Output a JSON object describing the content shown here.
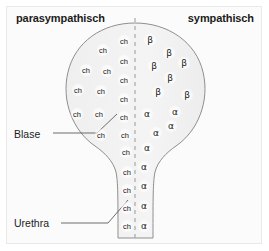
{
  "diagram": {
    "title_left": "parasympathisch",
    "title_right": "sympathisch",
    "labels": {
      "bladder": "Blase",
      "urethra": "Urethra"
    },
    "colors": {
      "left_fill_dark": "#b9b9b9",
      "left_fill_light": "#d8d8d8",
      "right_fill": "#f2f2f2",
      "outline": "#8c8c8c",
      "midline_dash": "#a9a9a9",
      "text": "#1c1c1c",
      "background": "#fbfbfb",
      "frame_border": "#e9e9e9"
    },
    "midline": {
      "x": 135,
      "y_top": 18,
      "y_bottom": 240,
      "style": "dashed"
    },
    "receptors": {
      "cholinergic_label": "ch",
      "beta_label": "β",
      "alpha_label": "α",
      "cholinergic": [
        {
          "x": 124,
          "y": 41
        },
        {
          "x": 103,
          "y": 50
        },
        {
          "x": 124,
          "y": 61
        },
        {
          "x": 86,
          "y": 70
        },
        {
          "x": 107,
          "y": 71
        },
        {
          "x": 124,
          "y": 80
        },
        {
          "x": 78,
          "y": 90
        },
        {
          "x": 101,
          "y": 91
        },
        {
          "x": 124,
          "y": 99
        },
        {
          "x": 77,
          "y": 114
        },
        {
          "x": 99,
          "y": 114
        },
        {
          "x": 124,
          "y": 117
        },
        {
          "x": 101,
          "y": 135
        },
        {
          "x": 125,
          "y": 135
        },
        {
          "x": 126,
          "y": 152
        },
        {
          "x": 127,
          "y": 172
        },
        {
          "x": 127,
          "y": 190
        },
        {
          "x": 127,
          "y": 208
        },
        {
          "x": 127,
          "y": 226
        }
      ],
      "beta": [
        {
          "x": 150,
          "y": 40
        },
        {
          "x": 169,
          "y": 53
        },
        {
          "x": 184,
          "y": 63
        },
        {
          "x": 154,
          "y": 66
        },
        {
          "x": 170,
          "y": 78
        },
        {
          "x": 158,
          "y": 92
        },
        {
          "x": 187,
          "y": 95
        }
      ],
      "alpha": [
        {
          "x": 147,
          "y": 114
        },
        {
          "x": 175,
          "y": 112
        },
        {
          "x": 171,
          "y": 126
        },
        {
          "x": 156,
          "y": 133
        },
        {
          "x": 147,
          "y": 148
        },
        {
          "x": 144,
          "y": 167
        },
        {
          "x": 144,
          "y": 186
        },
        {
          "x": 144,
          "y": 206
        },
        {
          "x": 144,
          "y": 226
        }
      ]
    },
    "leaders": {
      "bladder": {
        "x1": 53,
        "y1": 133,
        "x2": 97,
        "y2": 133,
        "x3": 117,
        "y3": 114
      },
      "urethra": {
        "x1": 61,
        "y1": 223,
        "x2": 108,
        "y2": 223,
        "x3": 128,
        "y3": 200
      }
    }
  }
}
